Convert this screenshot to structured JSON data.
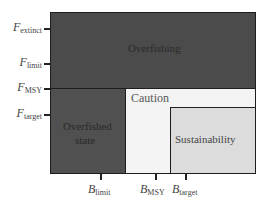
{
  "diagram": {
    "regions": {
      "overfishing": {
        "label": "Overfishing",
        "color": "#4b4b4b"
      },
      "overfished_state": {
        "label_line1": "Overfished",
        "label_line2": "state",
        "color": "#505050"
      },
      "caution": {
        "label": "Caution",
        "color": "#f4f4f4"
      },
      "sustainability": {
        "label": "Sustainability",
        "color": "#dcdcdc"
      }
    },
    "y_axis": {
      "ticks": [
        {
          "symbol": "F",
          "sub": "extinct"
        },
        {
          "symbol": "F",
          "sub": "limit"
        },
        {
          "symbol": "F",
          "sub": "MSY"
        },
        {
          "symbol": "F",
          "sub": "target"
        }
      ]
    },
    "x_axis": {
      "ticks": [
        {
          "symbol": "B",
          "sub": "limit"
        },
        {
          "symbol": "B",
          "sub": "MSY"
        },
        {
          "symbol": "B",
          "sub": "target"
        }
      ]
    }
  }
}
